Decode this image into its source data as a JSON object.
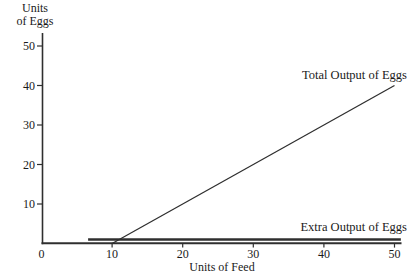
{
  "figure": {
    "background": "#ffffff",
    "line_color": "#2f2f2f",
    "text_color": "#1a1a1a"
  },
  "chart_data": {
    "type": "line",
    "title": "",
    "xlabel": "Units of Feed",
    "ylabel": "Units of Eggs",
    "ylabel_line1": "Units",
    "ylabel_line2": "of Eggs",
    "xlim": [
      0,
      51
    ],
    "ylim": [
      0,
      53
    ],
    "x_ticks": [
      0,
      10,
      20,
      30,
      40,
      50
    ],
    "y_ticks": [
      10,
      20,
      30,
      40,
      50
    ],
    "grid": false,
    "legend_position": "inline-annotations",
    "series": [
      {
        "name": "Total Output of Eggs",
        "slug": "total-output-of-eggs",
        "style": "thin",
        "points": [
          [
            10,
            0
          ],
          [
            50,
            40
          ]
        ]
      },
      {
        "name": "Extra Output of Eggs",
        "slug": "extra-output-of-eggs",
        "style": "thick",
        "points": [
          [
            6.6,
            1
          ],
          [
            50.9,
            1
          ]
        ]
      }
    ],
    "annotations": [
      {
        "text": "Total Output of Eggs",
        "x": 50,
        "y": 43
      },
      {
        "text": "Extra Output of Eggs",
        "x": 50,
        "y": 3
      }
    ]
  }
}
